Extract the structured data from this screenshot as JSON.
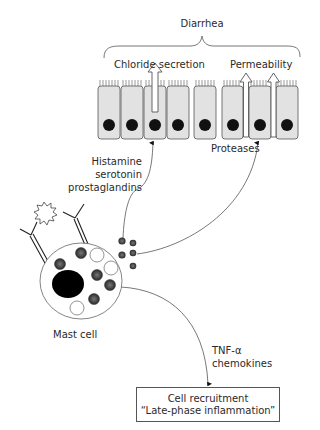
{
  "diagram": {
    "top_label": "Diarrhea",
    "effects": {
      "chloride": "Chloride secretion",
      "permeability": "Permeability"
    },
    "mediators_left": [
      "Histamine",
      "serotonin",
      "prostaglandins"
    ],
    "mediators_right": "Proteases",
    "cell_label": "Mast cell",
    "mediators_bottom": [
      "TNF-α",
      "chemokines"
    ],
    "outcome_box": {
      "line1": "Cell recruitment",
      "line2": "“Late-phase inflammation”"
    }
  },
  "colors": {
    "line": "#555555",
    "cell_fill": "#e2e2e2",
    "nucleus": "#111111",
    "granule": "#4a4a4a"
  }
}
